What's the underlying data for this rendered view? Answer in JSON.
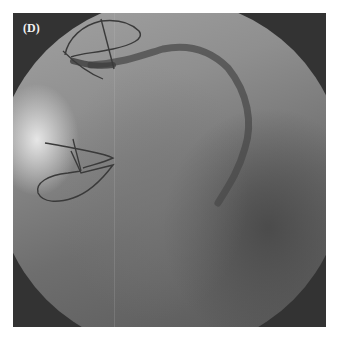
{
  "figure": {
    "panel_label": "(D)",
    "colors": {
      "background": "#ffffff",
      "frame": "#333333",
      "field_light": "#a4a4a4",
      "field_dark": "#555555",
      "wire": "#3a3a3a"
    }
  }
}
